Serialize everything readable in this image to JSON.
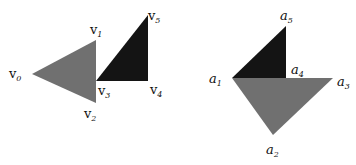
{
  "colors": {
    "gray": "#707070",
    "dark": "#141414",
    "background": "#ffffff"
  },
  "left_figure": {
    "labels": [
      {
        "base": "v",
        "sub": "0",
        "x": 9,
        "y": 78
      },
      {
        "base": "v",
        "sub": "1",
        "x": 90,
        "y": 34
      },
      {
        "base": "v",
        "sub": "2",
        "x": 84,
        "y": 118
      },
      {
        "base": "v",
        "sub": "3",
        "x": 98,
        "y": 95
      },
      {
        "base": "v",
        "sub": "4",
        "x": 150,
        "y": 94
      },
      {
        "base": "v",
        "sub": "5",
        "x": 148,
        "y": 20
      }
    ]
  },
  "right_figure": {
    "labels": [
      {
        "base": "a",
        "sub": "5",
        "x": 280,
        "y": 20
      },
      {
        "base": "a",
        "sub": "4",
        "x": 291,
        "y": 74
      },
      {
        "base": "a",
        "sub": "1",
        "x": 209,
        "y": 83
      },
      {
        "base": "a",
        "sub": "3",
        "x": 337,
        "y": 86
      },
      {
        "base": "a",
        "sub": "2",
        "x": 266,
        "y": 154
      }
    ]
  }
}
